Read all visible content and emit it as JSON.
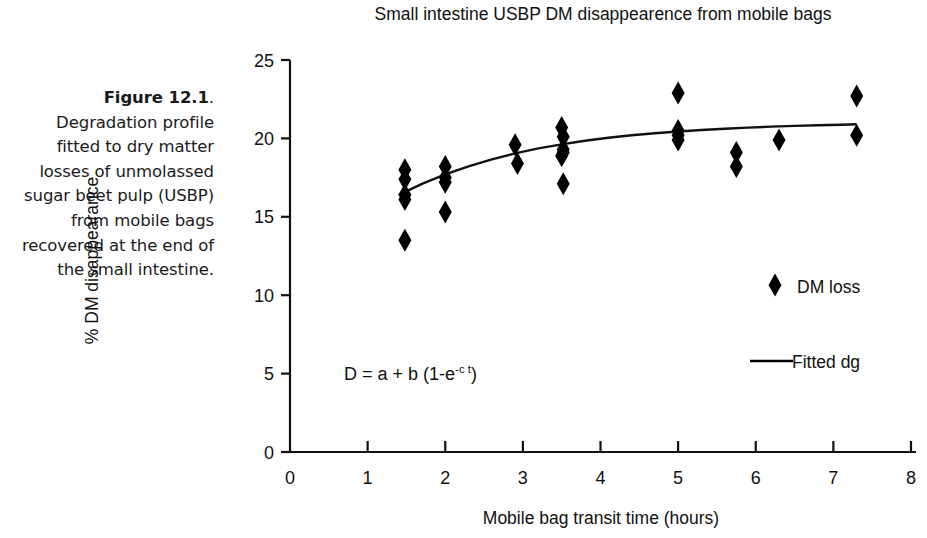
{
  "caption": {
    "figure_number": "Figure 12.1",
    "period": ".",
    "text": " Degradation profile fitted to dry matter losses of unmolassed sugar beet pulp (USBP) from mobile bags recovered at the end of the small intestine."
  },
  "chart_data": {
    "type": "scatter",
    "title": "Small intestine USBP DM disappearence from mobile bags",
    "xlabel": "Mobile bag transit time (hours)",
    "ylabel": "% DM disappearance",
    "xlim": [
      0,
      8
    ],
    "ylim": [
      0,
      25
    ],
    "xticks": [
      "0",
      "1",
      "2",
      "3",
      "4",
      "5",
      "6",
      "7",
      "8"
    ],
    "yticks": [
      "0",
      "5",
      "10",
      "15",
      "20",
      "25"
    ],
    "grid": false,
    "legend_position": "right",
    "marker_color": "#000000",
    "line_color": "#000000",
    "annotation": {
      "equation_prefix": "D = a + b (1-e",
      "equation_exponent": "-c t",
      "equation_suffix": ")"
    },
    "series": [
      {
        "name": "DM loss",
        "type": "scatter",
        "marker": "diamond",
        "points": [
          {
            "x": 1.48,
            "y": 18.0
          },
          {
            "x": 1.48,
            "y": 17.4
          },
          {
            "x": 1.48,
            "y": 16.4
          },
          {
            "x": 1.48,
            "y": 16.1
          },
          {
            "x": 1.48,
            "y": 13.5
          },
          {
            "x": 2.0,
            "y": 18.2
          },
          {
            "x": 2.0,
            "y": 17.5
          },
          {
            "x": 2.0,
            "y": 17.2
          },
          {
            "x": 2.0,
            "y": 15.3
          },
          {
            "x": 2.9,
            "y": 19.6
          },
          {
            "x": 2.93,
            "y": 18.4
          },
          {
            "x": 3.5,
            "y": 20.7
          },
          {
            "x": 3.52,
            "y": 20.1
          },
          {
            "x": 3.52,
            "y": 19.3
          },
          {
            "x": 3.52,
            "y": 19.1
          },
          {
            "x": 3.5,
            "y": 18.9
          },
          {
            "x": 3.52,
            "y": 17.1
          },
          {
            "x": 5.0,
            "y": 22.9
          },
          {
            "x": 5.0,
            "y": 20.5
          },
          {
            "x": 5.0,
            "y": 20.2
          },
          {
            "x": 5.0,
            "y": 19.9
          },
          {
            "x": 5.75,
            "y": 19.1
          },
          {
            "x": 5.75,
            "y": 18.2
          },
          {
            "x": 6.3,
            "y": 19.9
          },
          {
            "x": 7.3,
            "y": 22.7
          },
          {
            "x": 7.3,
            "y": 20.2
          }
        ]
      },
      {
        "name": "Fitted dg",
        "type": "line",
        "curve": [
          {
            "x": 1.4,
            "y": 16.4
          },
          {
            "x": 1.7,
            "y": 17.1
          },
          {
            "x": 2.0,
            "y": 17.7
          },
          {
            "x": 2.3,
            "y": 18.22
          },
          {
            "x": 2.6,
            "y": 18.66
          },
          {
            "x": 2.9,
            "y": 19.04
          },
          {
            "x": 3.2,
            "y": 19.36
          },
          {
            "x": 3.5,
            "y": 19.62
          },
          {
            "x": 3.8,
            "y": 19.85
          },
          {
            "x": 4.1,
            "y": 20.04
          },
          {
            "x": 4.4,
            "y": 20.2
          },
          {
            "x": 4.7,
            "y": 20.33
          },
          {
            "x": 5.0,
            "y": 20.44
          },
          {
            "x": 5.3,
            "y": 20.54
          },
          {
            "x": 5.6,
            "y": 20.62
          },
          {
            "x": 5.9,
            "y": 20.69
          },
          {
            "x": 6.2,
            "y": 20.75
          },
          {
            "x": 6.5,
            "y": 20.8
          },
          {
            "x": 6.8,
            "y": 20.84
          },
          {
            "x": 7.1,
            "y": 20.87
          },
          {
            "x": 7.3,
            "y": 20.9
          }
        ]
      }
    ]
  },
  "legend": {
    "items": [
      {
        "label": "DM loss",
        "marker": "diamond-marker"
      },
      {
        "label": "Fitted dg",
        "marker": "line-marker"
      }
    ]
  }
}
